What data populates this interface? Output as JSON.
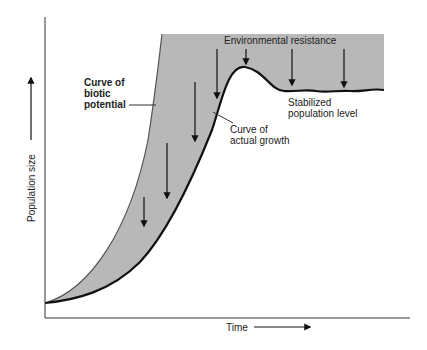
{
  "diagram": {
    "axes": {
      "x_label": "Time",
      "y_label": "Population size"
    },
    "labels": {
      "biotic_potential": [
        "Curve of",
        "biotic",
        "potential"
      ],
      "environmental_resistance": "Environmental resistance",
      "actual_growth": [
        "Curve of",
        "actual growth"
      ],
      "stabilized": [
        "Stabilized",
        "population level"
      ]
    },
    "colors": {
      "shade": "#b8b8b8",
      "curve": "#111111",
      "background": "#ffffff"
    }
  }
}
